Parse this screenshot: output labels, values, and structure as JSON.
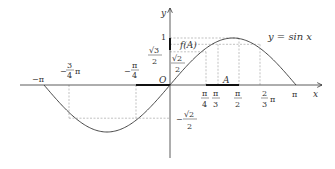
{
  "figure": {
    "function_label": "y = sin x",
    "axis_x_label": "x",
    "axis_y_label": "y",
    "origin_label": "O",
    "point_A_label": "A",
    "fA_label": "f(A)",
    "x_ticks": [
      {
        "id": "neg_pi",
        "num": "−π",
        "den": ""
      },
      {
        "id": "neg_3pi4",
        "num": "3",
        "den": "4",
        "sign": "−",
        "suffix": "π"
      },
      {
        "id": "neg_pi4",
        "num": "π",
        "den": "4",
        "sign": "−"
      },
      {
        "id": "pi4",
        "num": "π",
        "den": "4"
      },
      {
        "id": "pi3",
        "num": "π",
        "den": "3"
      },
      {
        "id": "pi2",
        "num": "π",
        "den": "2"
      },
      {
        "id": "2pi3",
        "num": "2",
        "den": "3",
        "suffix": "π"
      },
      {
        "id": "pi",
        "num": "π",
        "den": ""
      }
    ],
    "y_ticks": [
      {
        "id": "one",
        "num": "1",
        "den": ""
      },
      {
        "id": "sqrt3_2",
        "num": "√3",
        "den": "2"
      },
      {
        "id": "sqrt2_2",
        "num": "√2",
        "den": "2"
      },
      {
        "id": "neg_sqrt2_2",
        "num": "√2",
        "den": "2",
        "sign": "−"
      }
    ],
    "colors": {
      "curve": "#333333",
      "axis": "#333333",
      "guide": "#888888",
      "highlight": "#111111"
    }
  }
}
